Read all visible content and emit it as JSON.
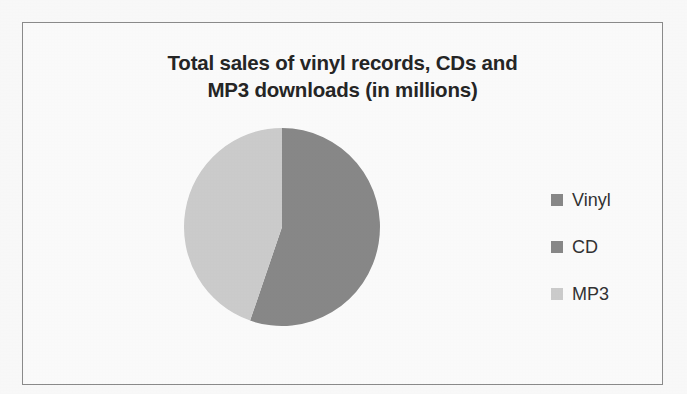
{
  "figure": {
    "border_color": "#8d8d8d",
    "background": "#ffffff"
  },
  "title": {
    "line1": "Total sales of vinyl records, CDs and",
    "line2": "MP3 downloads  (in millions)"
  },
  "legend": {
    "position": "right",
    "entries": [
      {
        "label": "Vinyl",
        "color": "#8a8a8a"
      },
      {
        "label": "CD",
        "color": "#8a8a8a"
      },
      {
        "label": "MP3",
        "color": "#cfcfcf"
      }
    ]
  },
  "chart_data": {
    "type": "pie",
    "title": "Total sales of vinyl records, CDs and MP3 downloads  (in millions)",
    "xlabel": "",
    "ylabel": "",
    "legend_position": "right",
    "grid": false,
    "start_angle_deg": 0,
    "direction": "clockwise",
    "labels": [
      "Vinyl",
      "CD",
      "MP3"
    ],
    "colors": [
      "#8a8a8a",
      "#8a8a8a",
      "#cfcfcf"
    ],
    "values": [
      0,
      55,
      45
    ],
    "percentages": [
      0,
      55,
      45
    ],
    "slices": [
      {
        "label": "Vinyl",
        "value": 0,
        "percent": 0,
        "color": "#8a8a8a",
        "start_deg": 0,
        "end_deg": 0
      },
      {
        "label": "CD",
        "value": 55,
        "percent": 55,
        "color": "#8a8a8a",
        "start_deg": 0,
        "end_deg": 199
      },
      {
        "label": "MP3",
        "value": 45,
        "percent": 45,
        "color": "#cfcfcf",
        "start_deg": 199,
        "end_deg": 360
      }
    ],
    "annotations": []
  }
}
